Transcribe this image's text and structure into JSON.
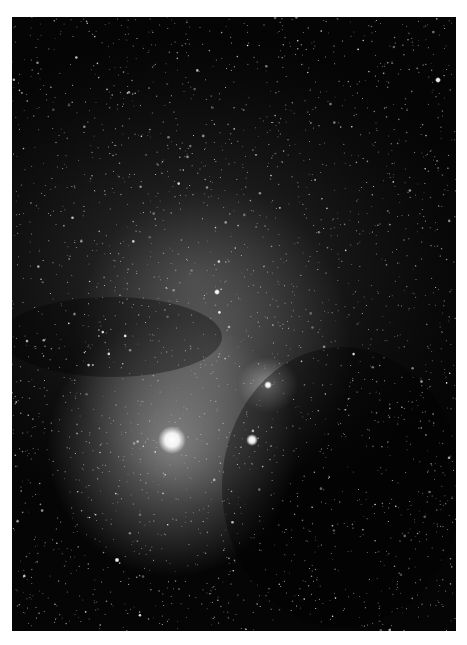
{
  "image": {
    "subject": "Wide-field astrophotograph of a dense star field with reflection/emission nebulosity and dark dust lanes",
    "frame": {
      "x": 12,
      "y": 17,
      "width": 444,
      "height": 614
    },
    "background_color": "#050505",
    "border_color": "#ffffff",
    "bright_stars": [
      {
        "name": "bright-star-main",
        "x": 172,
        "y": 440,
        "r": 11
      },
      {
        "name": "bright-star-secondary",
        "x": 240,
        "y": 440,
        "r": 5
      },
      {
        "name": "cluster-star",
        "x": 268,
        "y": 385,
        "r": 3
      },
      {
        "name": "star-upper-mid",
        "x": 205,
        "y": 275,
        "r": 2.5
      },
      {
        "name": "star-top-right",
        "x": 438,
        "y": 65,
        "r": 2.5
      },
      {
        "name": "star-lower-left",
        "x": 105,
        "y": 543,
        "r": 2
      }
    ],
    "nebulae": [
      {
        "name": "glow-around-main-star",
        "cx": 172,
        "cy": 430,
        "rx": 120,
        "ry": 130,
        "color": "#9a9a9a"
      },
      {
        "name": "nebula-right",
        "cx": 268,
        "cy": 385,
        "rx": 28,
        "ry": 26,
        "color": "#bdbdbd"
      },
      {
        "name": "nebula-central",
        "cx": 210,
        "cy": 300,
        "rx": 90,
        "ry": 90,
        "color": "#7a7a7a"
      }
    ]
  }
}
